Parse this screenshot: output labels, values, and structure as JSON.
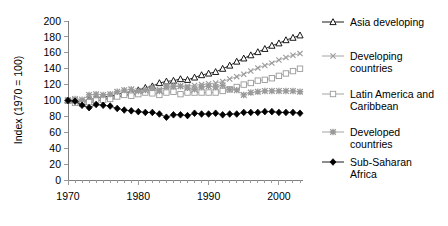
{
  "chart_data": {
    "type": "line",
    "title": "",
    "xlabel": "",
    "ylabel": "Index (1970 = 100)",
    "xlim": [
      1970,
      2003
    ],
    "ylim": [
      0,
      200
    ],
    "ytick_labels": [
      "200",
      "180",
      "160",
      "140",
      "120",
      "100",
      "80",
      "60",
      "40",
      "20",
      "0"
    ],
    "ytick_values": [
      200,
      180,
      160,
      140,
      120,
      100,
      80,
      60,
      40,
      20,
      0
    ],
    "xtick_labels": [
      "1970",
      "1980",
      "1990",
      "2000"
    ],
    "xtick_values": [
      1970,
      1980,
      1990,
      2000
    ],
    "grid": false,
    "legend_position": "right",
    "x": [
      1970,
      1971,
      1972,
      1973,
      1974,
      1975,
      1976,
      1977,
      1978,
      1979,
      1980,
      1981,
      1982,
      1983,
      1984,
      1985,
      1986,
      1987,
      1988,
      1989,
      1990,
      1991,
      1992,
      1993,
      1994,
      1995,
      1996,
      1997,
      1998,
      1999,
      2000,
      2001,
      2002,
      2003
    ],
    "series": [
      {
        "name": "Asia developing",
        "marker": "open-triangle",
        "color": "#000000",
        "values": [
          100,
          100,
          98,
          101,
          103,
          105,
          105,
          108,
          110,
          111,
          113,
          116,
          118,
          122,
          124,
          125,
          127,
          126,
          129,
          132,
          134,
          136,
          140,
          144,
          149,
          153,
          157,
          161,
          165,
          169,
          172,
          176,
          179,
          182
        ]
      },
      {
        "name": "Developing countries",
        "marker": "cross",
        "color": "#9a9a9a",
        "values": [
          100,
          101,
          99,
          102,
          103,
          104,
          104,
          106,
          108,
          108,
          109,
          111,
          112,
          114,
          116,
          117,
          118,
          118,
          119,
          120,
          121,
          122,
          124,
          127,
          130,
          133,
          137,
          141,
          144,
          147,
          151,
          154,
          157,
          159
        ]
      },
      {
        "name": "Latin America and Caribbean",
        "marker": "open-square",
        "color": "#9a9a9a",
        "values": [
          100,
          97,
          96,
          98,
          100,
          101,
          102,
          105,
          107,
          106,
          108,
          110,
          109,
          107,
          110,
          111,
          108,
          110,
          110,
          110,
          110,
          110,
          112,
          114,
          117,
          120,
          122,
          125,
          126,
          128,
          131,
          134,
          137,
          140
        ]
      },
      {
        "name": "Developed countries",
        "marker": "star",
        "color": "#9a9a9a",
        "values": [
          100,
          102,
          101,
          107,
          108,
          107,
          108,
          111,
          113,
          114,
          112,
          113,
          116,
          112,
          118,
          118,
          118,
          116,
          114,
          117,
          118,
          117,
          119,
          114,
          113,
          107,
          110,
          111,
          112,
          112,
          112,
          112,
          112,
          111
        ]
      },
      {
        "name": "Sub-Saharan Africa",
        "marker": "filled-diamond",
        "color": "#000000",
        "values": [
          100,
          99,
          94,
          91,
          95,
          94,
          93,
          90,
          88,
          87,
          86,
          85,
          85,
          83,
          79,
          82,
          82,
          81,
          84,
          83,
          83,
          84,
          82,
          83,
          83,
          85,
          85,
          85,
          86,
          86,
          85,
          85,
          85,
          84
        ]
      }
    ]
  },
  "legend": {
    "items": [
      {
        "label": "Asia developing"
      },
      {
        "label": "Developing\ncountries"
      },
      {
        "label": "Latin America and\nCaribbean"
      },
      {
        "label": "Developed\ncountries"
      },
      {
        "label": "Sub-Saharan\nAfrica"
      }
    ]
  }
}
